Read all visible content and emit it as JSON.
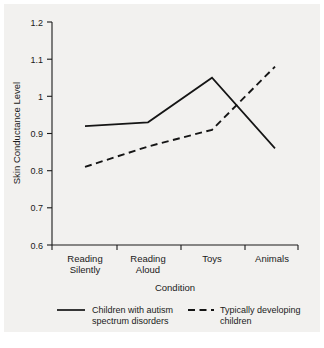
{
  "chart_data": {
    "type": "line",
    "title": "",
    "xlabel": "Condition",
    "ylabel": "Skin Conductance Level",
    "categories": [
      "Reading Silently",
      "Reading Aloud",
      "Toys",
      "Animals"
    ],
    "category_lines": [
      [
        "Reading",
        "Silently"
      ],
      [
        "Reading",
        "Aloud"
      ],
      [
        "Toys",
        ""
      ],
      [
        "Animals",
        ""
      ]
    ],
    "ylim": [
      0.6,
      1.2
    ],
    "yticks": [
      0.6,
      0.7,
      0.8,
      0.9,
      1.0,
      1.1,
      1.2
    ],
    "ytick_labels": [
      "0.6",
      "0.7",
      "0.8",
      "0.9",
      "1",
      "1.1",
      "1.2"
    ],
    "grid": false,
    "legend_position": "bottom",
    "series": [
      {
        "name": "Children with autism spectrum disorders",
        "name_lines": [
          "Children with autism",
          "spectrum disorders"
        ],
        "style": "solid",
        "color": "#151515",
        "values": [
          0.92,
          0.93,
          1.05,
          0.86
        ]
      },
      {
        "name": "Typically developing children",
        "name_lines": [
          "Typically developing",
          "children"
        ],
        "style": "dashed",
        "color": "#151515",
        "values": [
          0.81,
          0.865,
          0.91,
          1.08
        ]
      }
    ]
  },
  "figure": {
    "background_color": "#f2f1ef",
    "axis_color": "#1a1a1a"
  }
}
